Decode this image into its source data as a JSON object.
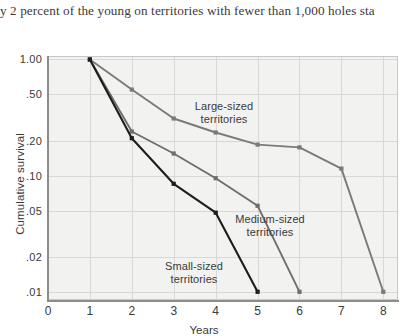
{
  "page": {
    "body_text_fragment": "y 2 percent of the young on territories with fewer than 1,000 holes sta"
  },
  "chart_data": {
    "type": "line",
    "title": "",
    "xlabel": "Years",
    "ylabel": "Cumulative survival",
    "yscale": "log",
    "xlim": [
      0,
      8.35
    ],
    "ylim": [
      0.0085,
      1.05
    ],
    "grid": true,
    "legend_position": "inline-annotations",
    "x_ticks": [
      "0",
      "1",
      "2",
      "3",
      "4",
      "5",
      "6",
      "7",
      "8"
    ],
    "x_tick_values": [
      0,
      1,
      2,
      3,
      4,
      5,
      6,
      7,
      8
    ],
    "y_ticks": [
      "1.00",
      ".50",
      ".20",
      ".10",
      ".05",
      ".02",
      ".01"
    ],
    "y_tick_values": [
      1.0,
      0.5,
      0.2,
      0.1,
      0.05,
      0.02,
      0.01
    ],
    "series": [
      {
        "name": "Large-sized territories",
        "annotation": "Large-sized\nterritories",
        "color": "#7a7a78",
        "marker": "square",
        "x": [
          1,
          2,
          3,
          4,
          5,
          6,
          7,
          8
        ],
        "values": [
          1.0,
          0.55,
          0.31,
          0.235,
          0.185,
          0.175,
          0.115,
          0.01
        ]
      },
      {
        "name": "Medium-sized territories",
        "annotation": "Medium-sized\nterritories",
        "color": "#6e6e6c",
        "marker": "square",
        "x": [
          1,
          2,
          3,
          4,
          5,
          6
        ],
        "values": [
          1.0,
          0.24,
          0.155,
          0.095,
          0.055,
          0.01
        ]
      },
      {
        "name": "Small-sized territories",
        "annotation": "Small-sized\nterritories",
        "color": "#1d1d1b",
        "marker": "square",
        "x": [
          1,
          2,
          3,
          4,
          5
        ],
        "values": [
          1.0,
          0.21,
          0.085,
          0.048,
          0.01
        ]
      }
    ]
  }
}
